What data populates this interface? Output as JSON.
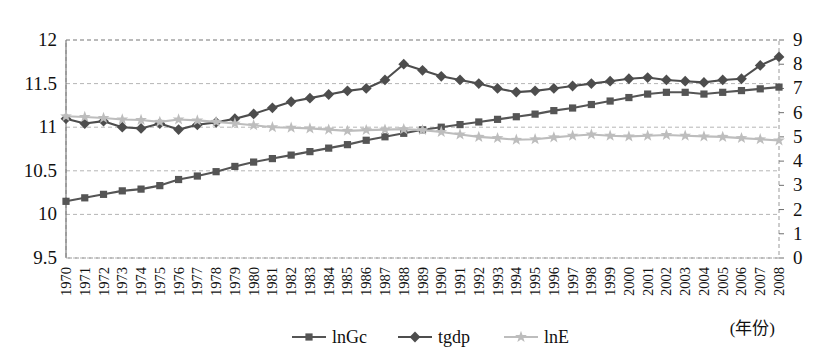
{
  "chart_data": {
    "type": "line",
    "title": "",
    "xlabel": "(年份)",
    "ylabel": "",
    "y2label": "",
    "grid": true,
    "legend_position": "bottom",
    "categories": [
      "1970",
      "1971",
      "1972",
      "1973",
      "1974",
      "1975",
      "1976",
      "1977",
      "1978",
      "1979",
      "1980",
      "1981",
      "1982",
      "1983",
      "1984",
      "1985",
      "1986",
      "1987",
      "1988",
      "1989",
      "1990",
      "1991",
      "1992",
      "1993",
      "1994",
      "1995",
      "1996",
      "1997",
      "1998",
      "1999",
      "2000",
      "2001",
      "2002",
      "2003",
      "2004",
      "2005",
      "2006",
      "2007",
      "2008"
    ],
    "left_axis": {
      "ticks": [
        "9.5",
        "10",
        "10.5",
        "11",
        "11.5",
        "12"
      ],
      "min": 9.5,
      "max": 12,
      "step": 0.5
    },
    "right_axis": {
      "ticks": [
        "0",
        "1",
        "2",
        "3",
        "4",
        "5",
        "6",
        "7",
        "8",
        "9"
      ],
      "min": 0,
      "max": 9,
      "step": 1
    },
    "series": [
      {
        "name": "lnGc",
        "axis": "left",
        "marker": "square",
        "color": "#555555",
        "values": [
          10.15,
          10.19,
          10.23,
          10.27,
          10.29,
          10.33,
          10.4,
          10.44,
          10.49,
          10.55,
          10.6,
          10.64,
          10.68,
          10.72,
          10.76,
          10.8,
          10.85,
          10.89,
          10.93,
          10.97,
          11.0,
          11.03,
          11.06,
          11.09,
          11.12,
          11.15,
          11.19,
          11.22,
          11.26,
          11.3,
          11.34,
          11.38,
          11.4,
          11.4,
          11.38,
          11.4,
          11.42,
          11.44,
          11.46
        ]
      },
      {
        "name": "tgdp",
        "axis": "right",
        "marker": "diamond",
        "color": "#4d4d4d",
        "values": [
          5.75,
          5.55,
          5.65,
          5.4,
          5.35,
          5.55,
          5.3,
          5.5,
          5.6,
          5.75,
          5.95,
          6.2,
          6.45,
          6.6,
          6.75,
          6.9,
          7.0,
          7.35,
          8.0,
          7.75,
          7.5,
          7.35,
          7.2,
          7.0,
          6.85,
          6.9,
          7.0,
          7.1,
          7.2,
          7.3,
          7.4,
          7.45,
          7.35,
          7.3,
          7.25,
          7.35,
          7.4,
          7.95,
          8.3
        ]
      },
      {
        "name": "lnE",
        "axis": "right",
        "marker": "star",
        "color": "#bdbdbd",
        "values": [
          5.85,
          5.82,
          5.78,
          5.72,
          5.7,
          5.62,
          5.72,
          5.68,
          5.62,
          5.55,
          5.48,
          5.4,
          5.38,
          5.35,
          5.3,
          5.25,
          5.28,
          5.3,
          5.32,
          5.28,
          5.2,
          5.1,
          5.0,
          4.95,
          4.88,
          4.9,
          4.98,
          5.05,
          5.1,
          5.05,
          5.02,
          5.05,
          5.08,
          5.05,
          5.02,
          5.0,
          4.95,
          4.9,
          4.85
        ]
      }
    ]
  },
  "legend": {
    "items": [
      {
        "label": "lnGc",
        "marker": "square",
        "color": "#555555"
      },
      {
        "label": "tgdp",
        "marker": "diamond",
        "color": "#4d4d4d"
      },
      {
        "label": "lnE",
        "marker": "star",
        "color": "#bdbdbd"
      }
    ]
  },
  "colors": {
    "gridline": "#b5b5b5",
    "border": "#9a9a9a",
    "text": "#111111"
  }
}
